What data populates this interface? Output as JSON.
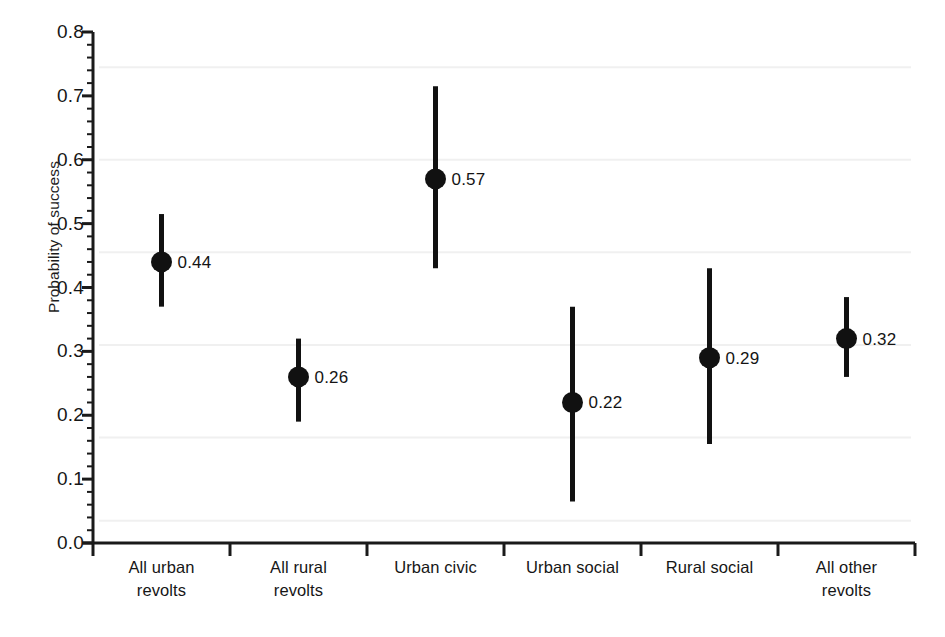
{
  "chart_data": {
    "type": "scatter",
    "title": "",
    "subtitle": "",
    "xlabel": "",
    "ylabel": "Probability of success",
    "ylim": [
      0.0,
      0.8
    ],
    "ytick_labels": [
      "0.0",
      "0.1",
      "0.2",
      "0.3",
      "0.4",
      "0.5",
      "0.6",
      "0.7",
      "0.8"
    ],
    "ytick_values": [
      0.0,
      0.1,
      0.2,
      0.3,
      0.4,
      0.5,
      0.6,
      0.7,
      0.8
    ],
    "minor_ticks": true,
    "grid": false,
    "legend": "none",
    "marker": "filled-circle",
    "error_bars": "vertical-range",
    "categories": [
      "All urban\nrevolts",
      "All rural\nrevolts",
      "Urban civic",
      "Urban social",
      "Rural social",
      "All other\nrevolts"
    ],
    "values": [
      0.44,
      0.26,
      0.57,
      0.22,
      0.29,
      0.32
    ],
    "value_labels": [
      "0.44",
      "0.26",
      "0.57",
      "0.22",
      "0.29",
      "0.32"
    ],
    "ci_low": [
      0.37,
      0.19,
      0.43,
      0.065,
      0.155,
      0.26
    ],
    "ci_high": [
      0.515,
      0.32,
      0.715,
      0.37,
      0.43,
      0.385
    ],
    "series": [
      {
        "name": "Probability of success",
        "points": [
          {
            "category": "All urban revolts",
            "value": 0.44,
            "label": "0.44",
            "ci_low": 0.37,
            "ci_high": 0.515
          },
          {
            "category": "All rural revolts",
            "value": 0.26,
            "label": "0.26",
            "ci_low": 0.19,
            "ci_high": 0.32
          },
          {
            "category": "Urban civic",
            "value": 0.57,
            "label": "0.57",
            "ci_low": 0.43,
            "ci_high": 0.715
          },
          {
            "category": "Urban social",
            "value": 0.22,
            "label": "0.22",
            "ci_low": 0.065,
            "ci_high": 0.37
          },
          {
            "category": "Rural social",
            "value": 0.29,
            "label": "0.29",
            "ci_low": 0.155,
            "ci_high": 0.43
          },
          {
            "category": "All other revolts",
            "value": 0.32,
            "label": "0.32",
            "ci_low": 0.26,
            "ci_high": 0.385
          }
        ]
      }
    ],
    "colors": {
      "marker": "#111111",
      "error_bar": "#111111",
      "axis": "#1a1a1a",
      "background": "#ffffff",
      "text": "#161616"
    }
  }
}
